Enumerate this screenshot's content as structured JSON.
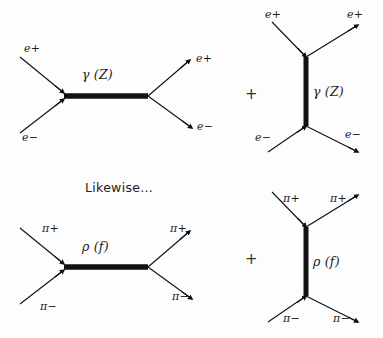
{
  "figure": {
    "background_color": "#fdfdfd",
    "ink_color": "#111111",
    "note": "Likewise...",
    "plus_sign": "+"
  },
  "diagrams": [
    {
      "id": "ee-s-channel",
      "name": "electron-positron s-channel annihilation",
      "channel": "s",
      "propagator_label": "γ (Z)",
      "propagator_orientation": "horizontal",
      "legs": [
        {
          "name": "incoming-positron",
          "label": "e+",
          "side": "in",
          "position": "upper-left"
        },
        {
          "name": "incoming-electron",
          "label": "e−",
          "side": "in",
          "position": "lower-left"
        },
        {
          "name": "outgoing-positron",
          "label": "e+",
          "side": "out",
          "position": "upper-right"
        },
        {
          "name": "outgoing-electron",
          "label": "e−",
          "side": "out",
          "position": "lower-right"
        }
      ]
    },
    {
      "id": "ee-t-channel",
      "name": "electron-positron t-channel exchange",
      "channel": "t",
      "propagator_label": "γ (Z)",
      "propagator_orientation": "vertical",
      "legs": [
        {
          "name": "incoming-positron",
          "label": "e+",
          "side": "in",
          "position": "upper-left"
        },
        {
          "name": "outgoing-positron",
          "label": "e+",
          "side": "out",
          "position": "upper-right"
        },
        {
          "name": "incoming-electron",
          "label": "e−",
          "side": "in",
          "position": "lower-left"
        },
        {
          "name": "outgoing-electron",
          "label": "e−",
          "side": "out",
          "position": "lower-right"
        }
      ]
    },
    {
      "id": "pipi-s-channel",
      "name": "pion-pion s-channel annihilation",
      "channel": "s",
      "propagator_label": "ρ (f)",
      "propagator_orientation": "horizontal",
      "legs": [
        {
          "name": "incoming-pi-plus",
          "label": "π+",
          "side": "in",
          "position": "upper-left"
        },
        {
          "name": "incoming-pi-minus",
          "label": "π−",
          "side": "in",
          "position": "lower-left"
        },
        {
          "name": "outgoing-pi-plus",
          "label": "π+",
          "side": "out",
          "position": "upper-right"
        },
        {
          "name": "outgoing-pi-minus",
          "label": "π−",
          "side": "out",
          "position": "lower-right"
        }
      ]
    },
    {
      "id": "pipi-t-channel",
      "name": "pion-pion t-channel exchange",
      "channel": "t",
      "propagator_label": "ρ (f)",
      "propagator_orientation": "vertical",
      "legs": [
        {
          "name": "incoming-pi-plus",
          "label": "π+",
          "side": "in",
          "position": "upper-left"
        },
        {
          "name": "outgoing-pi-plus",
          "label": "π+",
          "side": "out",
          "position": "upper-right"
        },
        {
          "name": "incoming-pi-minus",
          "label": "π−",
          "side": "in",
          "position": "lower-left"
        },
        {
          "name": "outgoing-pi-minus",
          "label": "π−",
          "side": "out",
          "position": "lower-right"
        }
      ]
    }
  ]
}
